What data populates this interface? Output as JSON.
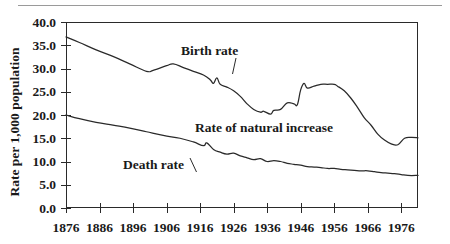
{
  "chart_data": {
    "type": "line",
    "title": "",
    "subtitle": "",
    "xlabel": "",
    "ylabel": "Rate per 1,000 population",
    "xlim": [
      1876,
      1981
    ],
    "ylim": [
      0.0,
      40.0
    ],
    "grid": false,
    "legend_position": "inline-annotations",
    "y_ticks": [
      "0.0",
      "5.0",
      "10.0",
      "15.0",
      "20.0",
      "25.0",
      "30.0",
      "35.0",
      "40.0"
    ],
    "y_tick_values": [
      0.0,
      5.0,
      10.0,
      15.0,
      20.0,
      25.0,
      30.0,
      35.0,
      40.0
    ],
    "x_ticks": [
      "1876",
      "1886",
      "1896",
      "1906",
      "1916",
      "1926",
      "1936",
      "1946",
      "1956",
      "1966",
      "1976"
    ],
    "x_tick_values": [
      1876,
      1886,
      1896,
      1906,
      1916,
      1926,
      1936,
      1946,
      1956,
      1966,
      1976
    ],
    "annotations": [
      {
        "text": "Birth rate",
        "x": 1911,
        "y": 34.0
      },
      {
        "text": "Rate of natural increase",
        "x": 1934,
        "y": 19.2
      },
      {
        "text": "Death rate",
        "x": 1894,
        "y": 12.2
      }
    ],
    "line_color": "#2a2a2a",
    "series": [
      {
        "name": "Birth rate",
        "x": [
          1876,
          1880,
          1885,
          1890,
          1895,
          1900,
          1902,
          1906,
          1908,
          1911,
          1914,
          1917,
          1919,
          1920,
          1921,
          1922,
          1924,
          1926,
          1928,
          1930,
          1932,
          1934,
          1935,
          1937,
          1938,
          1940,
          1942,
          1944,
          1945,
          1946,
          1947,
          1948,
          1950,
          1952,
          1954,
          1956,
          1957,
          1959,
          1961,
          1963,
          1965,
          1967,
          1969,
          1971,
          1973,
          1975,
          1977,
          1979,
          1981
        ],
        "y": [
          36.8,
          35.6,
          34.0,
          32.6,
          31.0,
          29.4,
          29.6,
          30.6,
          31.0,
          30.2,
          29.4,
          28.6,
          27.6,
          26.8,
          28.0,
          26.6,
          26.0,
          25.2,
          24.0,
          22.4,
          21.2,
          20.6,
          20.8,
          20.2,
          21.0,
          21.2,
          22.6,
          22.4,
          22.2,
          25.4,
          26.8,
          25.8,
          26.2,
          26.6,
          26.6,
          26.6,
          26.2,
          25.2,
          23.6,
          21.6,
          19.4,
          17.8,
          15.9,
          14.6,
          13.8,
          13.6,
          15.0,
          15.2,
          15.1
        ]
      },
      {
        "name": "Death rate",
        "x": [
          1876,
          1880,
          1885,
          1890,
          1895,
          1900,
          1905,
          1910,
          1914,
          1917,
          1918,
          1920,
          1922,
          1924,
          1926,
          1928,
          1930,
          1932,
          1934,
          1936,
          1938,
          1940,
          1942,
          1944,
          1946,
          1948,
          1950,
          1952,
          1954,
          1956,
          1958,
          1960,
          1962,
          1964,
          1966,
          1968,
          1970,
          1972,
          1974,
          1976,
          1978,
          1981
        ],
        "y": [
          20.0,
          19.2,
          18.4,
          17.8,
          17.2,
          16.4,
          15.6,
          15.0,
          14.2,
          13.4,
          14.0,
          12.6,
          12.0,
          11.6,
          11.8,
          11.2,
          10.8,
          10.4,
          10.6,
          10.0,
          10.2,
          10.0,
          9.6,
          9.4,
          9.2,
          8.9,
          8.8,
          8.7,
          8.5,
          8.5,
          8.3,
          8.2,
          8.1,
          8.0,
          8.0,
          7.8,
          7.6,
          7.5,
          7.4,
          7.2,
          7.0,
          7.0
        ]
      }
    ]
  },
  "axis": {
    "y_title": "Rate per 1,000 population"
  }
}
